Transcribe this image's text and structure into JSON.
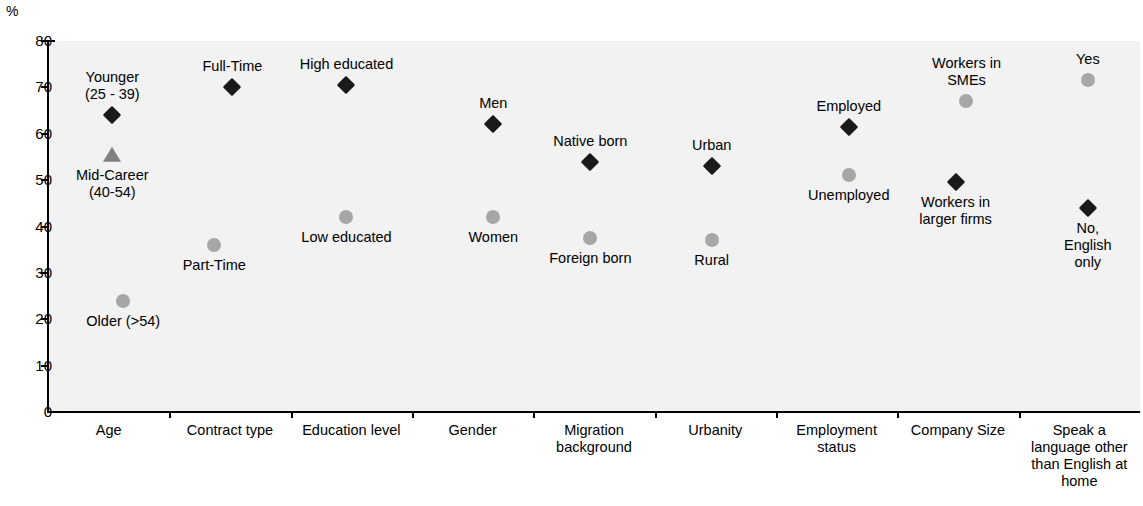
{
  "chart_data": {
    "type": "scatter",
    "title": "",
    "xlabel": "",
    "ylabel": "%",
    "ylim": [
      0,
      80
    ],
    "ytick_step": 10,
    "yticks": [
      80,
      70,
      60,
      50,
      40,
      30,
      20,
      10,
      0
    ],
    "grid": false,
    "legend": "none",
    "unit_label": "%",
    "categories": [
      "Age",
      "Contract type",
      "Education level",
      "Gender",
      "Migration\nbackground",
      "Urbanity",
      "Employment\nstatus",
      "Company Size",
      "Speak a\nlanguage other\nthan English at\nhome"
    ],
    "points": [
      {
        "category": "Age",
        "label": "Younger\n(25 - 39)",
        "value": 64,
        "marker": "diamond",
        "label_position": "above"
      },
      {
        "category": "Age",
        "label": "Mid-Career\n(40-54)",
        "value": 55.5,
        "marker": "triangle",
        "label_position": "below"
      },
      {
        "category": "Age",
        "label": "Older (>54)",
        "value": 24,
        "marker": "circle",
        "label_position": "below"
      },
      {
        "category": "Contract type",
        "label": "Full-Time",
        "value": 70,
        "marker": "diamond",
        "label_position": "above"
      },
      {
        "category": "Contract type",
        "label": "Part-Time",
        "value": 36,
        "marker": "circle",
        "label_position": "below"
      },
      {
        "category": "Education level",
        "label": "High educated",
        "value": 70.5,
        "marker": "diamond",
        "label_position": "above"
      },
      {
        "category": "Education level",
        "label": "Low educated",
        "value": 42,
        "marker": "circle",
        "label_position": "below"
      },
      {
        "category": "Gender",
        "label": "Men",
        "value": 62,
        "marker": "diamond",
        "label_position": "above"
      },
      {
        "category": "Gender",
        "label": "Women",
        "value": 42,
        "marker": "circle",
        "label_position": "below"
      },
      {
        "category": "Migration background",
        "label": "Native born",
        "value": 54,
        "marker": "diamond",
        "label_position": "above"
      },
      {
        "category": "Migration background",
        "label": "Foreign born",
        "value": 37.5,
        "marker": "circle",
        "label_position": "below"
      },
      {
        "category": "Urbanity",
        "label": "Urban",
        "value": 53,
        "marker": "diamond",
        "label_position": "above"
      },
      {
        "category": "Urbanity",
        "label": "Rural",
        "value": 37,
        "marker": "circle",
        "label_position": "below"
      },
      {
        "category": "Employment status",
        "label": "Employed",
        "value": 61.5,
        "marker": "diamond",
        "label_position": "above"
      },
      {
        "category": "Employment status",
        "label": "Unemployed",
        "value": 51,
        "marker": "circle",
        "label_position": "below"
      },
      {
        "category": "Company Size",
        "label": "Workers in\nSMEs",
        "value": 67,
        "marker": "circle",
        "label_position": "above"
      },
      {
        "category": "Company Size",
        "label": "Workers in\nlarger firms",
        "value": 49.5,
        "marker": "diamond",
        "label_position": "below"
      },
      {
        "category": "Speak a language other than English at home",
        "label": "Yes",
        "value": 71.5,
        "marker": "circle",
        "label_position": "above"
      },
      {
        "category": "Speak a language other than English at home",
        "label": "No,\nEnglish only",
        "value": 44,
        "marker": "diamond",
        "label_position": "below"
      }
    ],
    "colors": {
      "diamond": "#1a1a1a",
      "circle": "#a6a6a6",
      "triangle": "#808080",
      "plot_background": "#f2f2f2",
      "axis": "#000000"
    }
  }
}
